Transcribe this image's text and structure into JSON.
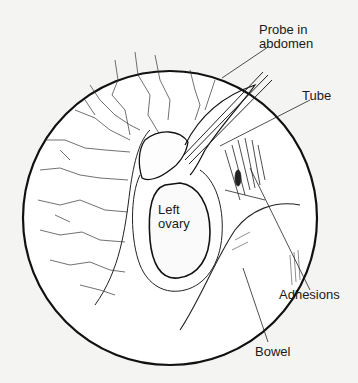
{
  "diagram": {
    "type": "laparoscopic view illustration",
    "labels": {
      "probe": "Probe in\nabdomen",
      "probe_line1": "Probe in",
      "probe_line2": "abdomen",
      "tube": "Tube",
      "ovary_line1": "Left",
      "ovary_line2": "ovary",
      "adhesions": "Adhesions",
      "bowel": "Bowel"
    },
    "colors": {
      "background": "#f4f4f2",
      "ink": "#1a1a1a",
      "field": "#ffffff"
    }
  }
}
